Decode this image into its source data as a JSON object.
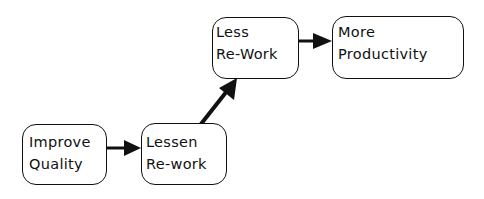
{
  "diagram": {
    "type": "flowchart",
    "colors": {
      "stroke": "#111111",
      "background": "#ffffff",
      "text": "#111111"
    },
    "nodes": [
      {
        "id": "improve",
        "lines": [
          "Improve",
          "Quality"
        ]
      },
      {
        "id": "lessen",
        "lines": [
          "Lessen",
          "Re-work"
        ]
      },
      {
        "id": "less",
        "lines": [
          "Less",
          "Re-Work"
        ]
      },
      {
        "id": "more",
        "lines": [
          "More",
          "Productivity"
        ]
      }
    ],
    "edges": [
      {
        "from": "improve",
        "to": "lessen",
        "direction": "right"
      },
      {
        "from": "lessen",
        "to": "less",
        "direction": "up-right"
      },
      {
        "from": "less",
        "to": "more",
        "direction": "right"
      }
    ]
  }
}
